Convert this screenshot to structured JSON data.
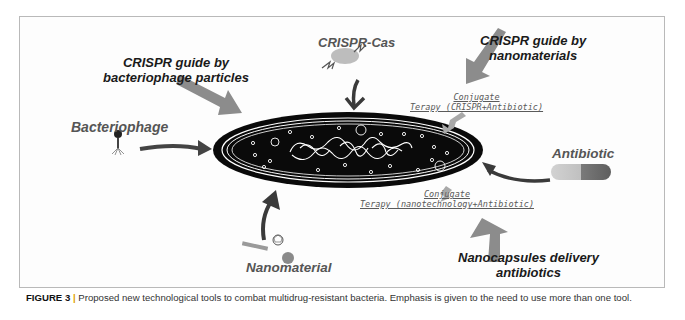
{
  "figure": {
    "labels": {
      "crispr_phage": [
        "CRISPR guide by",
        "bacteriophage particles"
      ],
      "crispr_cas": "CRISPR-Cas",
      "crispr_nano": [
        "CRISPR guide by",
        "nanomaterials"
      ],
      "bacteriophage": "Bacteriophage",
      "antibiotic": "Antibiotic",
      "nanomaterial": "Nanomaterial",
      "nanocapsules": [
        "Nanocapsules delivery",
        "antibiotics"
      ],
      "conjugate_crispr": [
        "Conjugate",
        "Terapy (CRISPR+Antibiotic)"
      ],
      "conjugate_nano": [
        "Conjugate",
        "Terapy (nanotechnology+Antibiotic)"
      ]
    },
    "icons": [
      "bacterium-cell-icon",
      "bacteriophage-icon",
      "crispr-cas-complex-icon",
      "antibiotic-capsule-icon",
      "nanotube-icon",
      "fullerene-icon",
      "nanoparticle-icon"
    ],
    "colors": {
      "cell": "#0a0a0a",
      "arrow_dark": "#3a3a3a",
      "arrow_gray": "#8c8c8c",
      "capsule_left": "#c8c8c8",
      "capsule_right": "#6e6e6e",
      "caption_separator": "#e0a000"
    }
  },
  "caption": {
    "label": "FIGURE 3",
    "separator": "|",
    "text": "Proposed new technological tools to combat multidrug-resistant bacteria. Emphasis is given to the need to use more than one tool."
  }
}
